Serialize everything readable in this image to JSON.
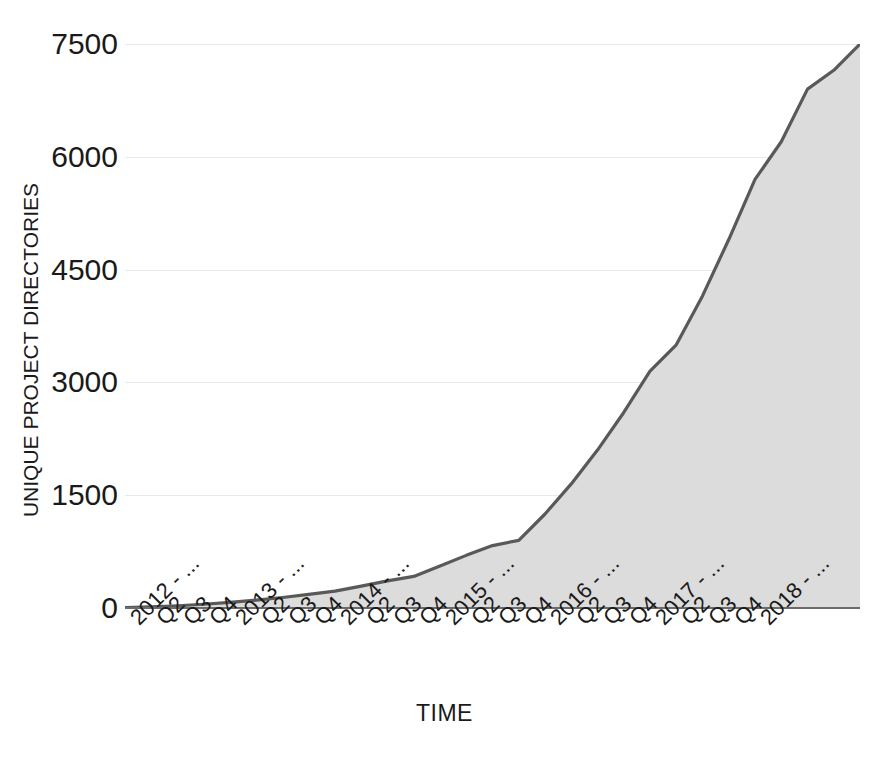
{
  "chart_data": {
    "type": "area",
    "title": "",
    "xlabel": "TIME",
    "ylabel": "UNIQUE PROJECT DIRECTORIES",
    "ylim": [
      0,
      7500
    ],
    "yticks": [
      0,
      1500,
      3000,
      4500,
      6000,
      7500
    ],
    "ytick_labels": [
      "0",
      "1500",
      "3000",
      "4500",
      "6000",
      "7500"
    ],
    "grid": true,
    "legend": "none",
    "line_color": "#595959",
    "fill_color": "#dcdcdc",
    "grid_color": "#e9e9e9",
    "axis_color": "#6b6b6b",
    "categories": [
      "2012 - ...",
      "Q2",
      "Q3",
      "Q4",
      "2013 - ...",
      "Q2",
      "Q3",
      "Q4",
      "2014 - ...",
      "Q2",
      "Q3",
      "Q4",
      "2015 - ...",
      "Q2",
      "Q3",
      "Q4",
      "2016 - ...",
      "Q2",
      "Q3",
      "Q4",
      "2017 - ...",
      "Q2",
      "Q3",
      "Q4",
      "2018 - ..."
    ],
    "values": [
      5,
      15,
      30,
      50,
      75,
      105,
      140,
      180,
      225,
      290,
      360,
      420,
      560,
      700,
      830,
      900,
      1250,
      1650,
      2100,
      2600,
      3150,
      3500,
      4150,
      4900,
      5700
    ],
    "series": [
      {
        "name": "Unique project directories",
        "values": [
          5,
          15,
          30,
          50,
          75,
          105,
          140,
          180,
          225,
          290,
          360,
          420,
          560,
          700,
          830,
          900,
          1250,
          1650,
          2100,
          2600,
          3150,
          3500,
          4150,
          4900,
          5700
        ]
      }
    ],
    "extra_points": {
      "note_end_rise": "curve continues steeply past last labeled tick to 7500",
      "tail_values": [
        6200,
        6900,
        7150,
        7500
      ]
    }
  },
  "axis": {
    "y_label_text": "UNIQUE PROJECT DIRECTORIES",
    "x_label_text": "TIME"
  }
}
